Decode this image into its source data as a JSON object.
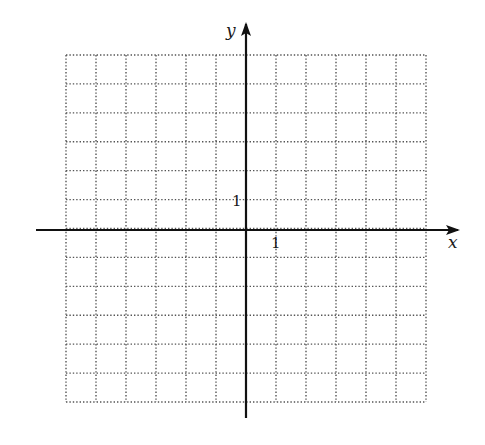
{
  "figure": {
    "type": "coordinate-plane",
    "grid": {
      "columns": 12,
      "rows": 12,
      "style": "dotted",
      "x_range": [
        -6,
        6
      ],
      "y_range": [
        -6,
        6
      ],
      "color": "#555555"
    },
    "axes": {
      "x_label": "x",
      "y_label": "y",
      "x_tick_label": "1",
      "y_tick_label": "1",
      "color": "#111111"
    }
  }
}
